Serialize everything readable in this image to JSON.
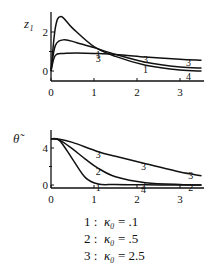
{
  "chart_data": [
    {
      "type": "line",
      "ylabel": "z₁",
      "xlabel": "",
      "xlim": [
        0,
        3.5
      ],
      "ylim": [
        -0.4,
        3.0
      ],
      "xticks": [
        "0",
        "1",
        "2",
        "3"
      ],
      "yticks": [
        "0",
        "2"
      ],
      "grid": false,
      "series": [
        {
          "name": "1",
          "x": [
            0,
            0.1,
            0.23,
            0.5,
            1.0,
            1.5,
            2.2,
            3.0,
            3.5
          ],
          "y": [
            0,
            2.2,
            2.8,
            2.2,
            1.25,
            0.75,
            0.3,
            0.05,
            0.0
          ]
        },
        {
          "name": "2",
          "x": [
            0,
            0.1,
            0.3,
            0.6,
            1.0,
            1.5,
            2.2,
            3.0,
            3.5
          ],
          "y": [
            0,
            1.3,
            1.6,
            1.45,
            1.2,
            0.85,
            0.45,
            0.2,
            0.15
          ]
        },
        {
          "name": "3",
          "x": [
            0,
            0.1,
            0.3,
            0.6,
            1.0,
            1.5,
            2.2,
            3.0,
            3.5
          ],
          "y": [
            0,
            0.8,
            0.9,
            0.92,
            0.9,
            0.85,
            0.72,
            0.6,
            0.55
          ]
        }
      ],
      "curve_labels": [
        {
          "text": "1",
          "x": 1.1,
          "y": 1.0
        },
        {
          "text": "3",
          "x": 1.1,
          "y": 0.75
        },
        {
          "text": "3",
          "x": 2.2,
          "y": 0.72
        },
        {
          "text": "1",
          "x": 2.2,
          "y": 0.2
        },
        {
          "text": "3",
          "x": 3.2,
          "y": 0.55
        },
        {
          "text": "4",
          "x": 3.2,
          "y": -0.15
        }
      ]
    },
    {
      "type": "line",
      "ylabel": "θ̃",
      "xlabel": "",
      "xlim": [
        0,
        3.5
      ],
      "ylim": [
        -0.3,
        5.8
      ],
      "xticks": [
        "0",
        "1",
        "2",
        "3"
      ],
      "yticks": [
        "0",
        "4"
      ],
      "grid": false,
      "series": [
        {
          "name": "1",
          "x": [
            0,
            0.2,
            0.5,
            0.8,
            1.1,
            1.5,
            2.2,
            3.0,
            3.5
          ],
          "y": [
            5.0,
            4.8,
            2.8,
            0.8,
            0.1,
            0.05,
            0.02,
            0.0,
            0.0
          ]
        },
        {
          "name": "2",
          "x": [
            0,
            0.2,
            0.5,
            0.8,
            1.1,
            1.5,
            2.2,
            3.0,
            3.5
          ],
          "y": [
            5.0,
            4.85,
            3.9,
            2.8,
            1.8,
            0.9,
            0.25,
            0.05,
            0.0
          ]
        },
        {
          "name": "3",
          "x": [
            0,
            0.2,
            0.5,
            1.1,
            1.5,
            2.2,
            3.0,
            3.5
          ],
          "y": [
            5.0,
            4.95,
            4.6,
            3.6,
            3.1,
            2.3,
            1.4,
            1.0
          ]
        }
      ],
      "curve_labels": [
        {
          "text": "3",
          "x": 1.1,
          "y": 3.6
        },
        {
          "text": "2",
          "x": 1.1,
          "y": 1.7
        },
        {
          "text": "1",
          "x": 1.1,
          "y": 0.0
        },
        {
          "text": "3",
          "x": 2.15,
          "y": 2.3
        },
        {
          "text": "2",
          "x": 2.15,
          "y": 0.2
        },
        {
          "text": "4",
          "x": 2.15,
          "y": -0.2
        },
        {
          "text": "3",
          "x": 3.25,
          "y": 1.25
        },
        {
          "text": "2",
          "x": 3.25,
          "y": 0.0
        }
      ]
    }
  ],
  "legend": {
    "entries": [
      {
        "num": "1 :",
        "sym": "κ₀",
        "val": "= .1"
      },
      {
        "num": "2 :",
        "sym": "κ₀",
        "val": "= .5"
      },
      {
        "num": "3 :",
        "sym": "κ₀",
        "val": "= 2.5"
      }
    ]
  }
}
